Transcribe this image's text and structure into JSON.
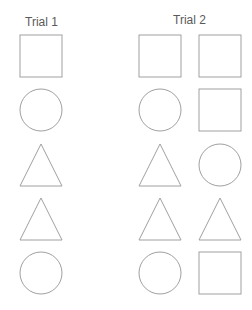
{
  "titles": {
    "trial1": "Trial 1",
    "trial2": "Trial 2"
  },
  "colors": {
    "stroke": "#a0a0a0",
    "text": "#5a5a5a",
    "background": "#ffffff"
  },
  "trials": [
    {
      "label": "Trial 1",
      "columns": [
        {
          "x": 41,
          "shapes": [
            "square",
            "circle",
            "triangle",
            "triangle",
            "circle"
          ]
        }
      ]
    },
    {
      "label": "Trial 2",
      "columns": [
        {
          "x": 160,
          "shapes": [
            "square",
            "circle",
            "triangle",
            "triangle",
            "circle"
          ]
        },
        {
          "x": 220,
          "shapes": [
            "square",
            "square",
            "circle",
            "triangle",
            "square"
          ]
        }
      ]
    }
  ],
  "rows_y": [
    56,
    110,
    165,
    219,
    273
  ],
  "shape_size": 42
}
